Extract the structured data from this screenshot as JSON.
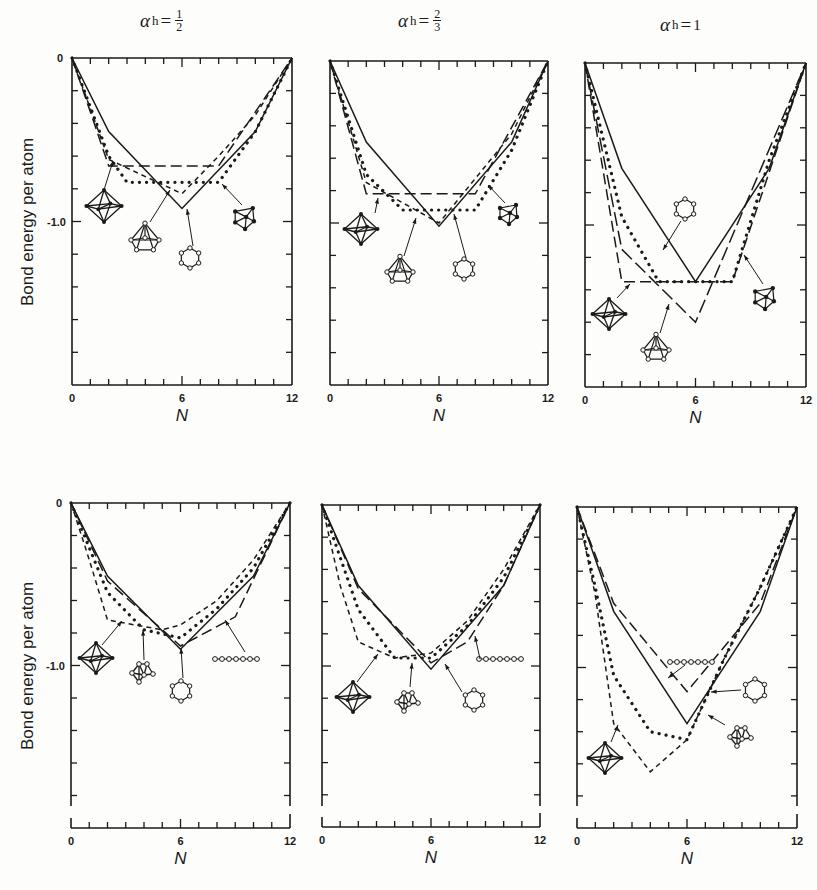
{
  "figure": {
    "column_titles": [
      {
        "symbol": "α",
        "sub": "h",
        "eq": "=",
        "num": "1",
        "den": "2"
      },
      {
        "symbol": "α",
        "sub": "h",
        "eq": "=",
        "num": "2",
        "den": "3"
      },
      {
        "symbol": "α",
        "sub": "h",
        "eq": "=",
        "value": "1"
      }
    ],
    "ylabel": "Bond energy per atom",
    "xlabel": "N",
    "x_ticks": [
      "0",
      "6",
      "12"
    ],
    "y_tick_labels": {
      "zero": "0",
      "minus_one": "-1.0"
    }
  },
  "chart_data": [
    {
      "type": "line",
      "panel": "top-left",
      "title": "αh = 1/2",
      "xlabel": "N",
      "ylabel": "Bond energy per atom",
      "xlim": [
        0,
        12
      ],
      "ylim": [
        -2.0,
        0
      ],
      "series": [
        {
          "name": "ring (hexagon)",
          "style": "solid",
          "x": [
            0,
            2,
            6,
            10,
            12
          ],
          "y": [
            0,
            -0.45,
            -0.92,
            -0.45,
            0
          ]
        },
        {
          "name": "octahedron",
          "style": "long-dash",
          "x": [
            0,
            2,
            8,
            12
          ],
          "y": [
            0,
            -0.66,
            -0.66,
            0
          ]
        },
        {
          "name": "capped pyramid",
          "style": "dotted",
          "x": [
            0,
            2,
            3,
            8,
            10,
            12
          ],
          "y": [
            0,
            -0.6,
            -0.76,
            -0.76,
            -0.45,
            0
          ]
        },
        {
          "name": "pentagonal pyramid",
          "style": "short-dash",
          "x": [
            0,
            2,
            6,
            8,
            10,
            12
          ],
          "y": [
            0,
            -0.62,
            -0.83,
            -0.6,
            -0.35,
            0
          ]
        }
      ],
      "annotations": [
        "octahedron",
        "pentagonal pyramid",
        "hexagon ring",
        "capped trigonal cluster"
      ]
    },
    {
      "type": "line",
      "panel": "top-middle",
      "title": "αh = 2/3",
      "xlabel": "N",
      "ylabel": "",
      "xlim": [
        0,
        12
      ],
      "ylim": [
        -2.0,
        0
      ],
      "series": [
        {
          "name": "ring (hexagon)",
          "style": "solid",
          "x": [
            0,
            2,
            6,
            10,
            12
          ],
          "y": [
            0,
            -0.5,
            -1.02,
            -0.5,
            0
          ]
        },
        {
          "name": "octahedron",
          "style": "long-dash",
          "x": [
            0,
            2,
            8,
            12
          ],
          "y": [
            0,
            -0.82,
            -0.82,
            0
          ]
        },
        {
          "name": "capped pyramid",
          "style": "dotted",
          "x": [
            0,
            2,
            4,
            8,
            10,
            12
          ],
          "y": [
            0,
            -0.7,
            -0.92,
            -0.92,
            -0.55,
            0
          ]
        },
        {
          "name": "pentagonal pyramid",
          "style": "short-dash",
          "x": [
            0,
            2,
            6,
            10,
            12
          ],
          "y": [
            0,
            -0.75,
            -1.0,
            -0.45,
            0
          ]
        }
      ],
      "annotations": [
        "octahedron",
        "pentagonal pyramid",
        "hexagon ring",
        "capped trigonal cluster"
      ]
    },
    {
      "type": "line",
      "panel": "top-right",
      "title": "αh = 1",
      "xlabel": "N",
      "ylabel": "",
      "xlim": [
        0,
        12
      ],
      "ylim": [
        -2.0,
        0
      ],
      "series": [
        {
          "name": "ring (hexagon)",
          "style": "solid",
          "x": [
            0,
            2,
            6,
            10,
            12
          ],
          "y": [
            0,
            -0.65,
            -1.35,
            -0.65,
            0
          ]
        },
        {
          "name": "octahedron",
          "style": "long-dash",
          "x": [
            0,
            2,
            8,
            12
          ],
          "y": [
            0,
            -1.35,
            -1.35,
            0
          ]
        },
        {
          "name": "capped pyramid",
          "style": "dotted",
          "x": [
            0,
            2,
            4,
            8,
            10,
            12
          ],
          "y": [
            0,
            -0.95,
            -1.35,
            -1.35,
            -0.6,
            0
          ]
        },
        {
          "name": "pentagonal pyramid",
          "style": "long-dash-2",
          "x": [
            0,
            2,
            6,
            12
          ],
          "y": [
            0,
            -1.15,
            -1.6,
            0
          ]
        }
      ],
      "annotations": [
        "hexagon ring",
        "octahedron",
        "pentagonal pyramid",
        "capped trigonal cluster"
      ]
    },
    {
      "type": "line",
      "panel": "bottom-left",
      "title": "αh = 1/2",
      "xlabel": "N",
      "ylabel": "Bond energy per atom",
      "xlim": [
        0,
        12
      ],
      "ylim": [
        -2.0,
        0
      ],
      "series": [
        {
          "name": "ring (hexagon)",
          "style": "solid",
          "x": [
            0,
            2,
            6,
            10,
            12
          ],
          "y": [
            0,
            -0.45,
            -0.9,
            -0.45,
            0
          ]
        },
        {
          "name": "chain",
          "style": "long-dash",
          "x": [
            0,
            2,
            6,
            9,
            12
          ],
          "y": [
            0,
            -0.48,
            -0.88,
            -0.7,
            0
          ]
        },
        {
          "name": "octahedron",
          "style": "short-dash",
          "x": [
            0,
            1,
            2,
            5,
            6,
            8,
            10,
            12
          ],
          "y": [
            0,
            -0.35,
            -0.72,
            -0.78,
            -0.75,
            -0.6,
            -0.35,
            0
          ]
        },
        {
          "name": "bicapped cluster",
          "style": "dotted",
          "x": [
            0,
            2,
            4,
            6,
            8,
            10,
            12
          ],
          "y": [
            0,
            -0.55,
            -0.78,
            -0.83,
            -0.65,
            -0.4,
            0
          ]
        }
      ],
      "annotations": [
        "octahedron",
        "bicapped cluster",
        "hexagon ring",
        "linear chain"
      ]
    },
    {
      "type": "line",
      "panel": "bottom-middle",
      "title": "αh = 2/3",
      "xlabel": "N",
      "ylabel": "",
      "xlim": [
        0,
        12
      ],
      "ylim": [
        -2.0,
        0
      ],
      "series": [
        {
          "name": "ring (hexagon)",
          "style": "solid",
          "x": [
            0,
            2,
            6,
            10,
            12
          ],
          "y": [
            0,
            -0.5,
            -1.02,
            -0.5,
            0
          ]
        },
        {
          "name": "chain",
          "style": "long-dash",
          "x": [
            0,
            2,
            6,
            8,
            10,
            12
          ],
          "y": [
            0,
            -0.52,
            -0.98,
            -0.85,
            -0.5,
            0
          ]
        },
        {
          "name": "octahedron",
          "style": "short-dash",
          "x": [
            0,
            1,
            2,
            4,
            6,
            8,
            10,
            12
          ],
          "y": [
            0,
            -0.5,
            -0.85,
            -0.95,
            -0.92,
            -0.72,
            -0.4,
            0
          ]
        },
        {
          "name": "bicapped cluster",
          "style": "dotted",
          "x": [
            0,
            2,
            4,
            6,
            8,
            10,
            12
          ],
          "y": [
            0,
            -0.65,
            -0.95,
            -0.95,
            -0.75,
            -0.45,
            0
          ]
        }
      ],
      "annotations": [
        "octahedron",
        "bicapped cluster",
        "hexagon ring",
        "linear chain"
      ]
    },
    {
      "type": "line",
      "panel": "bottom-right",
      "title": "αh = 1",
      "xlabel": "N",
      "ylabel": "",
      "xlim": [
        0,
        12
      ],
      "ylim": [
        -2.0,
        0
      ],
      "series": [
        {
          "name": "ring (hexagon)",
          "style": "solid",
          "x": [
            0,
            2,
            6,
            10,
            12
          ],
          "y": [
            0,
            -0.65,
            -1.35,
            -0.65,
            0
          ]
        },
        {
          "name": "chain",
          "style": "long-dash",
          "x": [
            0,
            2,
            6,
            10,
            12
          ],
          "y": [
            0,
            -0.6,
            -1.15,
            -0.6,
            0
          ]
        },
        {
          "name": "bicapped cluster",
          "style": "dotted",
          "x": [
            0,
            1,
            2,
            4,
            6,
            8,
            10,
            12
          ],
          "y": [
            0,
            -0.5,
            -1.05,
            -1.4,
            -1.45,
            -0.95,
            -0.5,
            0
          ]
        },
        {
          "name": "octahedron",
          "style": "short-dash",
          "x": [
            0,
            1,
            2,
            4,
            6,
            8,
            10,
            12
          ],
          "y": [
            0,
            -0.55,
            -1.35,
            -1.65,
            -1.45,
            -0.95,
            -0.5,
            0
          ]
        }
      ],
      "annotations": [
        "linear chain",
        "hexagon ring",
        "bicapped cluster",
        "octahedron"
      ]
    }
  ]
}
